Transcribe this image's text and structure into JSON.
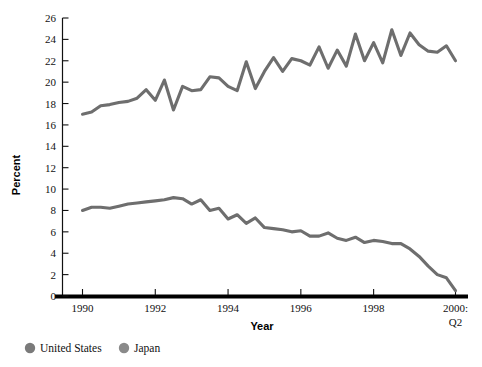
{
  "chart_data": {
    "type": "line",
    "title": "",
    "xlabel": "Year",
    "ylabel": "Percent",
    "ylim": [
      0,
      26
    ],
    "ytick_step": 2,
    "yticks": [
      0,
      2,
      4,
      6,
      8,
      10,
      12,
      14,
      16,
      18,
      20,
      22,
      24,
      26
    ],
    "xticks": [
      "1990",
      "1992",
      "1994",
      "1996",
      "1998",
      "2000:\nQ2"
    ],
    "xtick_labels": [
      "1990",
      "1992",
      "1994",
      "1996",
      "1998",
      "2000:"
    ],
    "xtick_last_second_line": "Q2",
    "grid": false,
    "legend_position": "bottom-left",
    "x_quarters": [
      "1990Q1",
      "1990Q2",
      "1990Q3",
      "1990Q4",
      "1991Q1",
      "1991Q2",
      "1991Q3",
      "1991Q4",
      "1992Q1",
      "1992Q2",
      "1992Q3",
      "1992Q4",
      "1993Q1",
      "1993Q2",
      "1993Q3",
      "1993Q4",
      "1994Q1",
      "1994Q2",
      "1994Q3",
      "1994Q4",
      "1995Q1",
      "1995Q2",
      "1995Q3",
      "1995Q4",
      "1996Q1",
      "1996Q2",
      "1996Q3",
      "1996Q4",
      "1997Q1",
      "1997Q2",
      "1997Q3",
      "1997Q4",
      "1998Q1",
      "1998Q2",
      "1998Q3",
      "1998Q4",
      "1999Q1",
      "1999Q2",
      "1999Q3",
      "1999Q4",
      "2000Q1",
      "2000Q2"
    ],
    "series": [
      {
        "name": "Japan",
        "color": "#6e6e6e",
        "values": [
          17.0,
          17.2,
          17.8,
          17.9,
          18.1,
          18.2,
          18.5,
          19.3,
          18.3,
          20.2,
          17.4,
          19.6,
          19.2,
          19.3,
          20.5,
          20.4,
          19.6,
          19.2,
          21.9,
          19.4,
          21.0,
          22.3,
          21.0,
          22.2,
          22.0,
          21.6,
          23.3,
          21.3,
          23.0,
          21.5,
          24.5,
          22.0,
          23.7,
          21.8,
          24.9,
          22.5,
          24.6,
          23.5,
          22.9,
          22.8,
          23.4,
          22.0
        ]
      },
      {
        "name": "United States",
        "color": "#6e6e6e",
        "values": [
          8.0,
          8.3,
          8.3,
          8.2,
          8.4,
          8.6,
          8.7,
          8.8,
          8.9,
          9.0,
          9.2,
          9.1,
          8.6,
          9.0,
          8.0,
          8.2,
          7.2,
          7.6,
          6.8,
          7.3,
          6.4,
          6.3,
          6.2,
          6.0,
          6.1,
          5.6,
          5.6,
          5.9,
          5.4,
          5.2,
          5.5,
          5.0,
          5.2,
          5.1,
          4.9,
          4.9,
          4.4,
          3.7,
          2.8,
          2.0,
          1.7,
          0.5
        ]
      }
    ],
    "legend": [
      {
        "label": "United States",
        "color": "#7a7a7a",
        "marker": "circle"
      },
      {
        "label": "Japan",
        "color": "#8a8a8a",
        "marker": "circle"
      }
    ]
  },
  "axis": {
    "y_label": "Percent",
    "x_label": "Year"
  },
  "style": {
    "background": "#ffffff",
    "axis_color": "#000000",
    "line_color": "#6e6e6e",
    "text_color": "#111111"
  }
}
